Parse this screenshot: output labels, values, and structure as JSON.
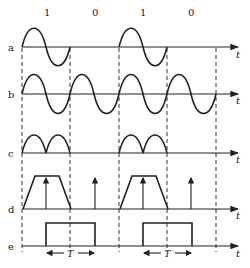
{
  "figure": {
    "bit_labels": [
      "1",
      "0",
      "1",
      "0"
    ],
    "row_labels": [
      "a",
      "b",
      "c",
      "d",
      "e"
    ],
    "axis_label": "t",
    "period_label": "T",
    "rows": {
      "a": "modulated signal (2PSK/OOK-style sine bursts for bits 1)",
      "b": "continuous sine carrier",
      "c": "full-wave rectified bursts",
      "d": "trapezoid envelope with sampling impulses",
      "e": "recovered rectangular pulses of width T"
    },
    "colors": {
      "line": "#222222",
      "background": "#ffffff"
    }
  }
}
